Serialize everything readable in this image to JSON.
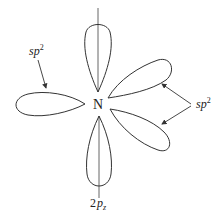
{
  "diagram": {
    "center_atom": "N",
    "labels": {
      "sp2_left": {
        "base": "sp",
        "sup": "2"
      },
      "sp2_right": {
        "base": "sp",
        "sup": "2"
      },
      "p_orbital": {
        "coef": "2",
        "base": "p",
        "sub": "z"
      }
    },
    "orbitals": [
      {
        "name": "2pz-upper-lobe",
        "type": "p"
      },
      {
        "name": "2pz-lower-lobe",
        "type": "p"
      },
      {
        "name": "sp2-left",
        "type": "sp2"
      },
      {
        "name": "sp2-upper-right",
        "type": "sp2"
      },
      {
        "name": "sp2-lower-right",
        "type": "sp2"
      }
    ],
    "stroke_color": "#333333"
  }
}
